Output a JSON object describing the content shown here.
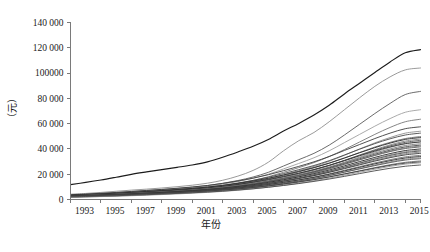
{
  "chart_data": {
    "type": "line",
    "title": "",
    "xlabel": "年份",
    "ylabel": "（元）",
    "xlim": [
      1993,
      2016
    ],
    "ylim": [
      0,
      140000
    ],
    "grid": false,
    "legend": "none",
    "x": [
      1993,
      1994,
      1995,
      1996,
      1997,
      1998,
      1999,
      2000,
      2001,
      2002,
      2003,
      2004,
      2005,
      2006,
      2007,
      2008,
      2009,
      2010,
      2011,
      2012,
      2013,
      2014,
      2015,
      2016
    ],
    "xticks": [
      1993,
      1995,
      1997,
      1999,
      2001,
      2003,
      2005,
      2007,
      2009,
      2011,
      2013,
      2015
    ],
    "xtick_labels": [
      "1993",
      "1995",
      "1997",
      "1999",
      "2001",
      "2003",
      "2005",
      "2007",
      "2009",
      "2011",
      "2013",
      "2015"
    ],
    "yticks": [
      0,
      20000,
      40000,
      60000,
      80000,
      100000,
      120000,
      140000
    ],
    "ytick_labels": [
      "0",
      "20 000",
      "40 000",
      "60 000",
      "80 000",
      "100000",
      "120 000",
      "140 000"
    ],
    "series": [
      {
        "name": "series-01",
        "color": "#1c1c1c",
        "width": 1.15,
        "values": [
          11800,
          13500,
          15400,
          17600,
          19900,
          21800,
          23600,
          25400,
          27300,
          29800,
          33400,
          37600,
          42100,
          47500,
          54100,
          60200,
          66800,
          74500,
          83500,
          92000,
          100500,
          108800,
          116000,
          118500
        ]
      },
      {
        "name": "series-02",
        "color": "#8e8e8e",
        "width": 0.9,
        "values": [
          4200,
          4800,
          5600,
          6500,
          7400,
          8200,
          9100,
          10100,
          11300,
          12900,
          15200,
          18500,
          23000,
          29500,
          38500,
          46500,
          53000,
          61500,
          71000,
          80500,
          89500,
          97000,
          102500,
          104000
        ]
      },
      {
        "name": "series-03",
        "color": "#5a5a5a",
        "width": 0.9,
        "values": [
          3500,
          4000,
          4700,
          5400,
          6200,
          7000,
          7800,
          8700,
          9700,
          11000,
          12800,
          15000,
          17800,
          21500,
          26500,
          31500,
          36500,
          43000,
          51000,
          59500,
          68000,
          76000,
          83000,
          85500
        ]
      },
      {
        "name": "series-04",
        "color": "#a0a0a0",
        "width": 0.9,
        "values": [
          3300,
          3800,
          4400,
          5100,
          5800,
          6500,
          7300,
          8200,
          9200,
          10400,
          12100,
          14200,
          16800,
          20000,
          24200,
          28500,
          33000,
          38500,
          45000,
          51500,
          58000,
          64000,
          69000,
          71000
        ]
      },
      {
        "name": "series-05",
        "color": "#777777",
        "width": 0.9,
        "values": [
          3000,
          3400,
          3900,
          4500,
          5200,
          5900,
          6600,
          7400,
          8300,
          9400,
          10900,
          12800,
          15100,
          18000,
          21500,
          25200,
          29200,
          34000,
          39500,
          45500,
          51500,
          57000,
          61500,
          63500
        ]
      },
      {
        "name": "series-06",
        "color": "#3d3d3d",
        "width": 0.9,
        "values": [
          3800,
          4300,
          4900,
          5600,
          6400,
          7200,
          8000,
          8900,
          9900,
          11100,
          12700,
          14600,
          16900,
          19600,
          22800,
          26200,
          29800,
          34000,
          38800,
          43500,
          48200,
          52500,
          56000,
          57500
        ]
      },
      {
        "name": "series-07",
        "color": "#909090",
        "width": 0.9,
        "values": [
          2600,
          3000,
          3500,
          4100,
          4700,
          5400,
          6100,
          6900,
          7800,
          8900,
          10300,
          12000,
          14100,
          16600,
          19600,
          22800,
          26200,
          30200,
          35000,
          40000,
          44800,
          49000,
          52500,
          54000
        ]
      },
      {
        "name": "series-08",
        "color": "#4a4a4a",
        "width": 0.9,
        "values": [
          3200,
          3600,
          4200,
          4800,
          5500,
          6200,
          7000,
          7800,
          8700,
          9800,
          11200,
          13000,
          15100,
          17600,
          20500,
          23600,
          26900,
          30700,
          35200,
          39800,
          44200,
          48000,
          51000,
          52500
        ]
      },
      {
        "name": "series-09",
        "color": "#6e6e6e",
        "width": 0.9,
        "values": [
          2900,
          3300,
          3800,
          4400,
          5000,
          5700,
          6400,
          7200,
          8100,
          9100,
          10400,
          12000,
          13900,
          16200,
          18900,
          21800,
          25000,
          28600,
          32800,
          37200,
          41500,
          45200,
          48200,
          49800
        ]
      },
      {
        "name": "series-10",
        "color": "#2b2b2b",
        "width": 0.9,
        "values": [
          3400,
          3900,
          4400,
          5000,
          5700,
          6400,
          7100,
          7900,
          8800,
          9800,
          11100,
          12700,
          14600,
          16800,
          19400,
          22200,
          25300,
          28800,
          32800,
          37000,
          41000,
          44600,
          47500,
          49000
        ]
      },
      {
        "name": "series-11",
        "color": "#858585",
        "width": 0.9,
        "values": [
          2400,
          2800,
          3200,
          3700,
          4300,
          4900,
          5600,
          6300,
          7100,
          8100,
          9300,
          10800,
          12600,
          14800,
          17300,
          20100,
          23200,
          26800,
          30900,
          35200,
          39400,
          43200,
          46200,
          47800
        ]
      },
      {
        "name": "series-12",
        "color": "#565656",
        "width": 0.9,
        "values": [
          2800,
          3200,
          3700,
          4200,
          4800,
          5500,
          6200,
          6900,
          7800,
          8800,
          10000,
          11500,
          13300,
          15400,
          17900,
          20600,
          23600,
          27000,
          30900,
          35000,
          38900,
          42400,
          45200,
          46800
        ]
      },
      {
        "name": "series-13",
        "color": "#999999",
        "width": 0.9,
        "values": [
          2200,
          2600,
          3000,
          3500,
          4000,
          4600,
          5200,
          5900,
          6700,
          7600,
          8800,
          10200,
          11900,
          14000,
          16400,
          19100,
          22100,
          25600,
          29500,
          33600,
          37600,
          41200,
          44000,
          45500
        ]
      },
      {
        "name": "series-14",
        "color": "#333333",
        "width": 0.9,
        "values": [
          3100,
          3500,
          4000,
          4600,
          5200,
          5900,
          6600,
          7400,
          8200,
          9200,
          10400,
          11900,
          13700,
          15800,
          18200,
          20800,
          23700,
          27000,
          30700,
          34600,
          38300,
          41600,
          44200,
          45600
        ]
      },
      {
        "name": "series-15",
        "color": "#7c7c7c",
        "width": 0.9,
        "values": [
          2700,
          3100,
          3500,
          4000,
          4600,
          5200,
          5900,
          6600,
          7400,
          8400,
          9600,
          11000,
          12700,
          14700,
          17000,
          19600,
          22400,
          25600,
          29200,
          33000,
          36700,
          40000,
          42700,
          44100
        ]
      },
      {
        "name": "series-16",
        "color": "#444444",
        "width": 0.9,
        "values": [
          2500,
          2900,
          3300,
          3800,
          4400,
          5000,
          5600,
          6300,
          7100,
          8000,
          9200,
          10600,
          12200,
          14200,
          16500,
          19000,
          21800,
          25000,
          28500,
          32200,
          35800,
          39000,
          41600,
          43000
        ]
      },
      {
        "name": "series-17",
        "color": "#8b8b8b",
        "width": 0.9,
        "values": [
          2000,
          2400,
          2800,
          3200,
          3700,
          4300,
          4900,
          5600,
          6400,
          7300,
          8400,
          9800,
          11400,
          13400,
          15700,
          18200,
          21000,
          24200,
          27800,
          31500,
          35100,
          38300,
          40900,
          42300
        ]
      },
      {
        "name": "series-18",
        "color": "#5f5f5f",
        "width": 0.9,
        "values": [
          2900,
          3300,
          3700,
          4200,
          4800,
          5400,
          6000,
          6700,
          7500,
          8400,
          9500,
          10800,
          12400,
          14300,
          16500,
          18900,
          21500,
          24500,
          27900,
          31400,
          34800,
          37900,
          40300,
          41600
        ]
      },
      {
        "name": "series-19",
        "color": "#262626",
        "width": 0.9,
        "values": [
          2600,
          3000,
          3400,
          3900,
          4400,
          5000,
          5600,
          6300,
          7000,
          7900,
          8900,
          10200,
          11700,
          13500,
          15600,
          17900,
          20400,
          23300,
          26600,
          30000,
          33300,
          36300,
          38700,
          40000
        ]
      },
      {
        "name": "series-20",
        "color": "#949494",
        "width": 0.9,
        "values": [
          1900,
          2200,
          2600,
          3000,
          3500,
          4000,
          4600,
          5200,
          5900,
          6700,
          7700,
          9000,
          10500,
          12300,
          14400,
          16700,
          19300,
          22300,
          25600,
          29000,
          32400,
          35400,
          37800,
          39100
        ]
      },
      {
        "name": "series-21",
        "color": "#4f4f4f",
        "width": 0.9,
        "values": [
          2400,
          2800,
          3200,
          3600,
          4100,
          4700,
          5300,
          5900,
          6600,
          7500,
          8500,
          9700,
          11200,
          12900,
          14900,
          17100,
          19600,
          22400,
          25500,
          28700,
          31900,
          34800,
          37100,
          38400
        ]
      },
      {
        "name": "series-22",
        "color": "#828282",
        "width": 0.9,
        "values": [
          2100,
          2400,
          2800,
          3200,
          3700,
          4200,
          4800,
          5400,
          6100,
          6900,
          7900,
          9100,
          10600,
          12300,
          14300,
          16500,
          18900,
          21700,
          24800,
          28000,
          31100,
          33900,
          36200,
          37500
        ]
      },
      {
        "name": "series-23",
        "color": "#393939",
        "width": 0.9,
        "values": [
          2700,
          3000,
          3400,
          3800,
          4300,
          4900,
          5400,
          6000,
          6700,
          7500,
          8500,
          9600,
          11000,
          12600,
          14500,
          16600,
          18900,
          21500,
          24400,
          27400,
          30400,
          33100,
          35300,
          36500
        ]
      },
      {
        "name": "series-24",
        "color": "#707070",
        "width": 0.9,
        "values": [
          2200,
          2500,
          2900,
          3300,
          3800,
          4300,
          4800,
          5400,
          6100,
          6900,
          7800,
          8900,
          10200,
          11800,
          13600,
          15600,
          17800,
          20300,
          23100,
          26000,
          28900,
          31500,
          33700,
          34900
        ]
      },
      {
        "name": "series-25",
        "color": "#2f2f2f",
        "width": 0.9,
        "values": [
          2500,
          2800,
          3200,
          3600,
          4000,
          4500,
          5100,
          5700,
          6300,
          7100,
          8000,
          9100,
          10300,
          11800,
          13500,
          15400,
          17500,
          19900,
          22600,
          25400,
          28200,
          30700,
          32800,
          34000
        ]
      },
      {
        "name": "series-26",
        "color": "#8a8a8a",
        "width": 0.9,
        "values": [
          1800,
          2100,
          2400,
          2800,
          3200,
          3700,
          4200,
          4800,
          5400,
          6100,
          7000,
          8000,
          9300,
          10800,
          12500,
          14400,
          16500,
          19000,
          21700,
          24500,
          27300,
          29800,
          31900,
          33100
        ]
      },
      {
        "name": "series-27",
        "color": "#555555",
        "width": 0.9,
        "values": [
          2300,
          2600,
          3000,
          3400,
          3800,
          4300,
          4800,
          5400,
          6000,
          6700,
          7600,
          8600,
          9800,
          11200,
          12900,
          14700,
          16700,
          19000,
          21600,
          24200,
          26800,
          29200,
          31200,
          32300
        ]
      },
      {
        "name": "series-28",
        "color": "#6b6b6b",
        "width": 0.9,
        "values": [
          2000,
          2300,
          2600,
          3000,
          3400,
          3900,
          4400,
          4900,
          5500,
          6200,
          7000,
          8000,
          9100,
          10500,
          12000,
          13700,
          15600,
          17800,
          20200,
          22700,
          25200,
          27500,
          29400,
          30500
        ]
      },
      {
        "name": "series-29",
        "color": "#3e3e3e",
        "width": 0.9,
        "values": [
          2600,
          2900,
          3200,
          3600,
          4000,
          4400,
          4900,
          5400,
          6000,
          6700,
          7500,
          8400,
          9500,
          10800,
          12300,
          14000,
          15800,
          17900,
          20200,
          22500,
          24800,
          27000,
          28700,
          29700
        ]
      },
      {
        "name": "series-30",
        "color": "#979797",
        "width": 0.9,
        "values": [
          1700,
          2000,
          2300,
          2600,
          3000,
          3400,
          3900,
          4400,
          5000,
          5600,
          6400,
          7300,
          8400,
          9700,
          11200,
          12900,
          14800,
          16900,
          19200,
          21600,
          24000,
          26200,
          28000,
          29000
        ]
      },
      {
        "name": "series-31",
        "color": "#484848",
        "width": 0.9,
        "values": [
          2100,
          2400,
          2700,
          3000,
          3400,
          3800,
          4300,
          4800,
          5300,
          5900,
          6600,
          7500,
          8500,
          9700,
          11100,
          12600,
          14300,
          16200,
          18300,
          20500,
          22700,
          24700,
          26300,
          27300
        ]
      }
    ]
  }
}
